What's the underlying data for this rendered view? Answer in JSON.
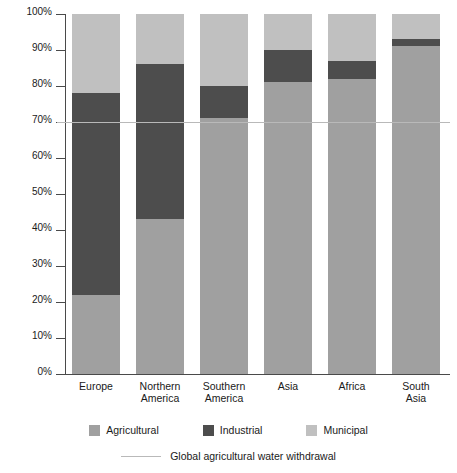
{
  "chart_data": {
    "type": "bar",
    "subtype": "stacked-bar-100-percent",
    "title": "",
    "subtitle": "",
    "xlabel": "",
    "ylabel": "",
    "ylim": [
      0,
      100
    ],
    "yticks": [
      "0%",
      "10%",
      "20%",
      "30%",
      "40%",
      "50%",
      "60%",
      "70%",
      "80%",
      "90%",
      "100%"
    ],
    "ytick_values": [
      0,
      10,
      20,
      30,
      40,
      50,
      60,
      70,
      80,
      90,
      100
    ],
    "grid": false,
    "legend_position": "bottom",
    "categories": [
      "Europe",
      "Northern America",
      "Southern America",
      "Asia",
      "Africa",
      "South Asia"
    ],
    "category_lines": [
      [
        "Europe"
      ],
      [
        "Northern",
        "America"
      ],
      [
        "Southern",
        "America"
      ],
      [
        "Asia"
      ],
      [
        "Africa"
      ],
      [
        "South",
        "Asia"
      ]
    ],
    "series": [
      {
        "name": "Agricultural",
        "color": "#a0a0a0",
        "values": [
          22,
          43,
          71,
          81,
          82,
          91
        ]
      },
      {
        "name": "Industrial",
        "color": "#4d4d4d",
        "values": [
          56,
          43,
          9,
          9,
          5,
          2
        ]
      },
      {
        "name": "Municipal",
        "color": "#c0c0c0",
        "values": [
          22,
          14,
          20,
          10,
          13,
          7
        ]
      }
    ],
    "cumulative_tops": {
      "Europe": {
        "agricultural": 22,
        "industrial": 78,
        "municipal": 100
      },
      "Northern America": {
        "agricultural": 43,
        "industrial": 86,
        "municipal": 100
      },
      "Southern America": {
        "agricultural": 71,
        "industrial": 80,
        "municipal": 100
      },
      "Asia": {
        "agricultural": 81,
        "industrial": 90,
        "municipal": 100
      },
      "Africa": {
        "agricultural": 82,
        "industrial": 87,
        "municipal": 100
      },
      "South Asia": {
        "agricultural": 91,
        "industrial": 93,
        "municipal": 100
      }
    },
    "annotations": [
      {
        "type": "hline",
        "label": "Global agricultural water withdrawal",
        "value": 70,
        "color": "#b9b9b9"
      }
    ],
    "legend_entries": [
      {
        "label": "Agricultural",
        "color": "#a0a0a0",
        "marker": "square"
      },
      {
        "label": "Industrial",
        "color": "#4d4d4d",
        "marker": "square"
      },
      {
        "label": "Municipal",
        "color": "#c0c0c0",
        "marker": "square"
      },
      {
        "label": "Global agricultural water withdrawal",
        "color": "#b9b9b9",
        "marker": "line"
      }
    ]
  },
  "colors": {
    "agricultural": "#a0a0a0",
    "industrial": "#4d4d4d",
    "municipal": "#c0c0c0",
    "reference_line": "#b9b9b9",
    "axis": "#4a4a4a",
    "background": "#ffffff",
    "text": "#1a1a1a"
  }
}
